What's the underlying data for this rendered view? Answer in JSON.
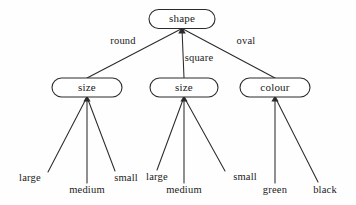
{
  "diagram": {
    "type": "decision-tree",
    "colors": {
      "background": "#fefefe",
      "stroke": "#2b2b2b",
      "node_fill": "#ffffff",
      "text": "#1a1a1a"
    },
    "root": {
      "id": "root-shape",
      "label": "shape",
      "cx": 182,
      "cy": 19,
      "rx": 33,
      "ry": 9.5
    },
    "branches": [
      {
        "id": "branch-round",
        "label": "round",
        "label_x": 123,
        "label_y": 42,
        "from_x": 182,
        "from_y": 28.5,
        "to_x": 87,
        "to_y": 78
      },
      {
        "id": "branch-square",
        "label": "square",
        "label_x": 199,
        "label_y": 59,
        "from_x": 182,
        "from_y": 28.5,
        "to_x": 184,
        "to_y": 78
      },
      {
        "id": "branch-oval",
        "label": "oval",
        "label_x": 246,
        "label_y": 42,
        "from_x": 182,
        "from_y": 28.5,
        "to_x": 275,
        "to_y": 78
      }
    ],
    "level2": [
      {
        "id": "node-size-round",
        "label": "size",
        "cx": 87,
        "cy": 87.5,
        "rx": 35,
        "ry": 9.5
      },
      {
        "id": "node-size-square",
        "label": "size",
        "cx": 184,
        "cy": 87.5,
        "rx": 34,
        "ry": 9.5
      },
      {
        "id": "node-colour-oval",
        "label": "colour",
        "cx": 275,
        "cy": 87.5,
        "rx": 35,
        "ry": 9.5
      }
    ],
    "leaves": [
      {
        "id": "leaf-large-round",
        "label": "large",
        "label_x": 30,
        "label_y": 179,
        "from_x": 87,
        "from_y": 97,
        "to_x": 48,
        "to_y": 172
      },
      {
        "id": "leaf-medium-round",
        "label": "medium",
        "label_x": 87,
        "label_y": 191,
        "from_x": 87,
        "from_y": 97,
        "to_x": 87,
        "to_y": 183
      },
      {
        "id": "leaf-small-round",
        "label": "small",
        "label_x": 126,
        "label_y": 179,
        "from_x": 87,
        "from_y": 97,
        "to_x": 115,
        "to_y": 171
      },
      {
        "id": "leaf-large-square",
        "label": "large",
        "label_x": 157,
        "label_y": 178,
        "from_x": 184,
        "from_y": 97,
        "to_x": 157,
        "to_y": 170
      },
      {
        "id": "leaf-medium-square",
        "label": "medium",
        "label_x": 184,
        "label_y": 191,
        "from_x": 184,
        "from_y": 97,
        "to_x": 184,
        "to_y": 183
      },
      {
        "id": "leaf-small-square",
        "label": "small",
        "label_x": 245,
        "label_y": 178,
        "from_x": 184,
        "from_y": 97,
        "to_x": 225,
        "to_y": 171
      },
      {
        "id": "leaf-green-colour",
        "label": "green",
        "label_x": 275,
        "label_y": 191,
        "from_x": 275,
        "from_y": 97,
        "to_x": 275,
        "to_y": 183
      },
      {
        "id": "leaf-black-colour",
        "label": "black",
        "label_x": 325,
        "label_y": 191,
        "from_x": 275,
        "from_y": 97,
        "to_x": 318,
        "to_y": 182
      }
    ]
  }
}
